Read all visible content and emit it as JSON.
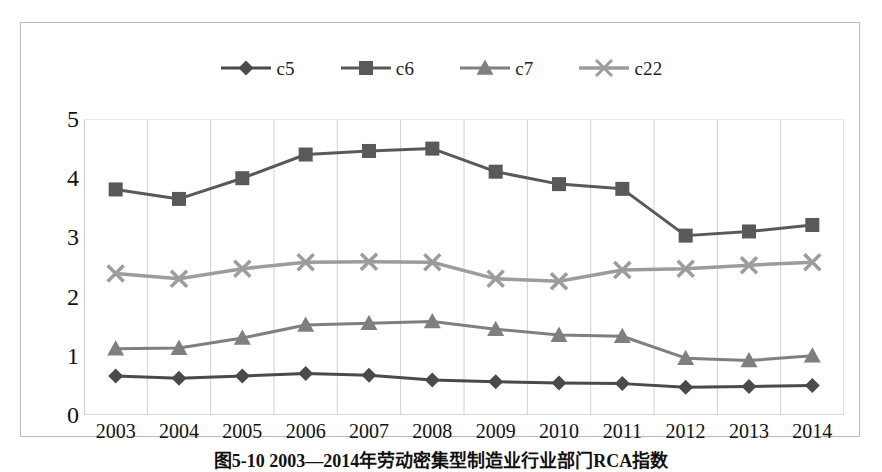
{
  "figure": {
    "caption": "图5-10  2003—2014年劳动密集型制造业行业部门RCA指数"
  },
  "chart_data": {
    "type": "line",
    "title": "",
    "xlabel": "",
    "ylabel": "",
    "ylim": [
      0,
      5
    ],
    "ytick_step": 1,
    "yticks": [
      "5",
      "4",
      "3",
      "2",
      "1",
      "0"
    ],
    "grid": "vertical",
    "legend_position": "top-center",
    "categories": [
      "2003",
      "2004",
      "2005",
      "2006",
      "2007",
      "2008",
      "2009",
      "2010",
      "2011",
      "2012",
      "2013",
      "2014"
    ],
    "series": [
      {
        "name": "c5",
        "marker": "diamond",
        "color": "#4a4a4a",
        "values": [
          0.66,
          0.62,
          0.66,
          0.7,
          0.67,
          0.59,
          0.56,
          0.54,
          0.53,
          0.47,
          0.48,
          0.5
        ]
      },
      {
        "name": "c6",
        "marker": "square",
        "color": "#595959",
        "values": [
          3.81,
          3.65,
          4.0,
          4.4,
          4.46,
          4.5,
          4.11,
          3.9,
          3.82,
          3.03,
          3.1,
          3.21
        ]
      },
      {
        "name": "c7",
        "marker": "triangle",
        "color": "#7f7f7f",
        "values": [
          1.12,
          1.13,
          1.3,
          1.52,
          1.55,
          1.58,
          1.45,
          1.35,
          1.33,
          0.96,
          0.92,
          1.0
        ]
      },
      {
        "name": "c22",
        "marker": "cross",
        "color": "#9c9c9c",
        "values": [
          2.39,
          2.3,
          2.47,
          2.58,
          2.59,
          2.58,
          2.3,
          2.26,
          2.45,
          2.47,
          2.53,
          2.58
        ]
      }
    ]
  }
}
